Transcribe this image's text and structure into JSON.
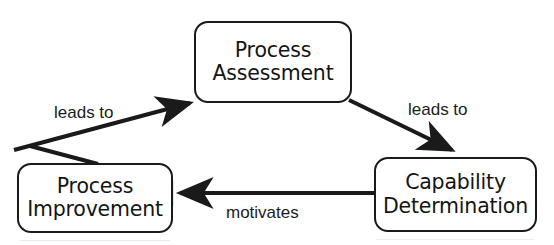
{
  "diagram": {
    "background_color": "#ffffff",
    "line_color": "#1a1a1a",
    "text_color": "#141414",
    "nodes": [
      {
        "id": "process-assessment",
        "lines": [
          "Process",
          "Assessment"
        ],
        "line1": "Process",
        "line2": "Assessment",
        "shape": "rounded-rectangle",
        "position": "top-center"
      },
      {
        "id": "process-improvement",
        "lines": [
          "Process",
          "Improvement"
        ],
        "line1": "Process",
        "line2": "Improvement",
        "shape": "rounded-rectangle",
        "position": "bottom-left"
      },
      {
        "id": "capability-determination",
        "lines": [
          "Capability",
          "Determination"
        ],
        "line1": "Capability",
        "line2": "Determination",
        "shape": "rounded-rectangle",
        "position": "bottom-right"
      }
    ],
    "edges": [
      {
        "id": "improvement-to-assessment",
        "label": "leads to",
        "from": "process-improvement",
        "to": "process-assessment",
        "direction": "up-right",
        "arrowhead": "end"
      },
      {
        "id": "assessment-to-capability",
        "label": "leads to",
        "from": "process-assessment",
        "to": "capability-determination",
        "direction": "down-right",
        "arrowhead": "end"
      },
      {
        "id": "capability-to-improvement",
        "label": "motivates",
        "from": "capability-determination",
        "to": "process-improvement",
        "direction": "left",
        "arrowhead": "end"
      }
    ]
  }
}
